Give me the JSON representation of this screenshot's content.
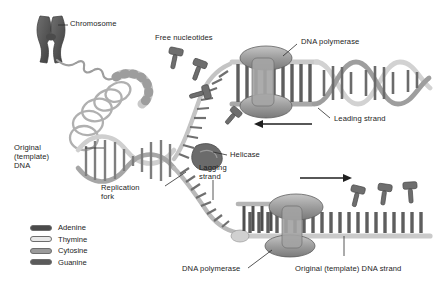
{
  "figure": {
    "background_color": "#ffffff",
    "text_color": "#1c1c1c"
  },
  "labels": {
    "chromosome": "Chromosome",
    "free_nucleotides": "Free nucleotides",
    "dna_polymerase_top": "DNA polymerase",
    "leading_strand": "Leading strand",
    "helicase": "Helicase",
    "lagging_strand_line1": "Lagging",
    "lagging_strand_line2": "strand",
    "replication_fork_line1": "Replication",
    "replication_fork_line2": "fork",
    "original_dna_line1": "Original",
    "original_dna_line2": "(template)",
    "original_dna_line3": "DNA",
    "dna_polymerase_bottom": "DNA polymerase",
    "original_template_strand": "Original (template) DNA strand"
  },
  "legend": {
    "items": [
      {
        "label": "Adenine",
        "color": "#4a4a4a"
      },
      {
        "label": "Thymine",
        "color": "#e8e8e8"
      },
      {
        "label": "Cytosine",
        "color": "#9a9a9a"
      },
      {
        "label": "Guanine",
        "color": "#5a5a5a"
      }
    ]
  },
  "palette": {
    "chromosome": "#565656",
    "backbone_light": "#d8d8d8",
    "backbone_mid": "#b4b4b4",
    "backbone_dark": "#8a8a8a",
    "base_dark": "#545454",
    "base_mid": "#8f8f8f",
    "base_light": "#ededed",
    "enzyme_fill": "#9d9d9d",
    "enzyme_stroke": "#5f5f5f",
    "outline": "#6d6d6d",
    "leader_line": "#2b2b2b",
    "arrow": "#1f1f1f"
  },
  "annotations": {
    "leading_arrow_direction": "left",
    "lagging_arrow_direction": "right"
  }
}
